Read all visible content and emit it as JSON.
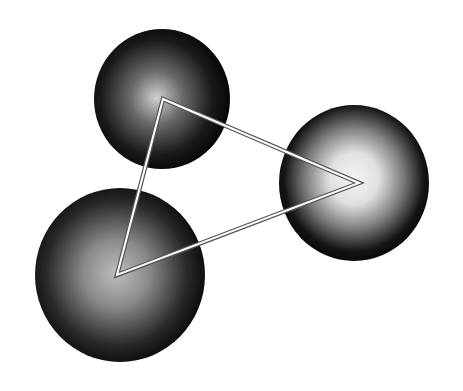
{
  "diagram": {
    "background": "#ffffff",
    "spheres": [
      {
        "id": "top",
        "highlight": "#cfcfcf",
        "edge": "#050505",
        "brightness": 0.75
      },
      {
        "id": "right",
        "highlight": "#f2f2f2",
        "edge": "#050505",
        "brightness": 1.0
      },
      {
        "id": "bottom-left",
        "highlight": "#bdbdbd",
        "edge": "#050505",
        "brightness": 0.7
      }
    ],
    "triangle": {
      "connects": [
        "top",
        "right",
        "bottom-left"
      ],
      "fill": "none",
      "stroke_outer": "#555555",
      "stroke_inner": "#ffffff"
    }
  }
}
